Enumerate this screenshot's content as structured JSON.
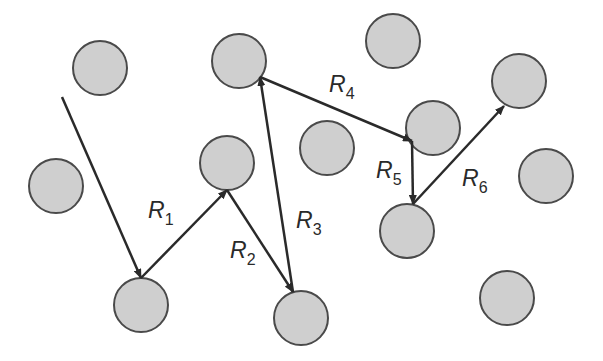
{
  "diagram": {
    "colors": {
      "circle_fill": "#cfcfcf",
      "circle_stroke": "#4a4a4a",
      "arrow": "#2a2a2a",
      "background": "#ffffff"
    },
    "circle_radius": 27,
    "circles": [
      {
        "x": 100,
        "y": 68
      },
      {
        "x": 239,
        "y": 61
      },
      {
        "x": 393,
        "y": 41
      },
      {
        "x": 519,
        "y": 81
      },
      {
        "x": 433,
        "y": 128
      },
      {
        "x": 327,
        "y": 148
      },
      {
        "x": 56,
        "y": 186
      },
      {
        "x": 227,
        "y": 163
      },
      {
        "x": 546,
        "y": 176
      },
      {
        "x": 407,
        "y": 231
      },
      {
        "x": 141,
        "y": 305
      },
      {
        "x": 301,
        "y": 318
      },
      {
        "x": 507,
        "y": 298
      }
    ],
    "start": {
      "x": 62,
      "y": 97
    },
    "segments": [
      {
        "label": "",
        "x1": 62,
        "y1": 97,
        "x2": 141,
        "y2": 278
      },
      {
        "label": "R",
        "sub": "1",
        "x1": 141,
        "y1": 278,
        "x2": 227,
        "y2": 190,
        "lx": 148,
        "ly": 218
      },
      {
        "label": "R",
        "sub": "2",
        "x1": 227,
        "y1": 190,
        "x2": 293,
        "y2": 292,
        "lx": 230,
        "ly": 258
      },
      {
        "label": "R",
        "sub": "3",
        "x1": 293,
        "y1": 292,
        "x2": 260,
        "y2": 77,
        "lx": 296,
        "ly": 228
      },
      {
        "label": "R",
        "sub": "4",
        "x1": 260,
        "y1": 77,
        "x2": 412,
        "y2": 141,
        "lx": 329,
        "ly": 92
      },
      {
        "label": "R",
        "sub": "5",
        "x1": 412,
        "y1": 141,
        "x2": 413,
        "y2": 204,
        "lx": 376,
        "ly": 178
      },
      {
        "label": "R",
        "sub": "6",
        "x1": 413,
        "y1": 204,
        "x2": 504,
        "y2": 106,
        "lx": 462,
        "ly": 186
      }
    ]
  }
}
